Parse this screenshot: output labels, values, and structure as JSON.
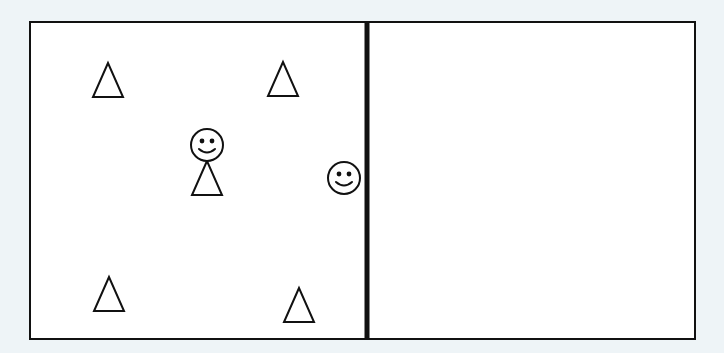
{
  "diagram": {
    "background": "#eef4f7",
    "frame": {
      "x": 30,
      "y": 22,
      "width": 665,
      "height": 317,
      "stroke": "#111111",
      "fill": "#ffffff",
      "stroke_width": 2
    },
    "divider": {
      "x": 367,
      "y1": 22,
      "y2": 339,
      "stroke": "#111111",
      "stroke_width": 5
    },
    "rooms": [
      {
        "name": "left-room",
        "x": 30,
        "y": 22,
        "width": 337,
        "height": 317
      },
      {
        "name": "right-room",
        "x": 367,
        "y": 22,
        "width": 328,
        "height": 317
      }
    ],
    "triangles": [
      {
        "name": "top-left",
        "cx": 108,
        "cy": 80,
        "w": 30,
        "h": 34
      },
      {
        "name": "top-right",
        "cx": 283,
        "cy": 79,
        "w": 30,
        "h": 34
      },
      {
        "name": "bottom-left",
        "cx": 109,
        "cy": 294,
        "w": 30,
        "h": 34
      },
      {
        "name": "bottom-right",
        "cx": 299,
        "cy": 305,
        "w": 30,
        "h": 34
      }
    ],
    "figures": [
      {
        "name": "person-with-body",
        "type": "smiley-with-triangle-body",
        "head_cx": 207,
        "head_cy": 145,
        "head_r": 16,
        "body_w": 30,
        "body_h": 34
      },
      {
        "name": "smiley-by-wall",
        "type": "smiley",
        "cx": 344,
        "cy": 178,
        "r": 16
      }
    ]
  }
}
